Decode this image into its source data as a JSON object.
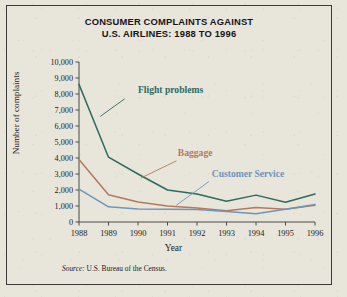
{
  "figure": {
    "title_line1": "CONSUMER COMPLAINTS AGAINST",
    "title_line2": "U.S. AIRLINES: 1988 TO 1996",
    "source_prefix": "Source:",
    "source_text": "U.S. Bureau of the Census.",
    "background_color": "#e8e5da",
    "border_color": "#3a3a38"
  },
  "chart_data": {
    "type": "line",
    "title": "CONSUMER COMPLAINTS AGAINST U.S. AIRLINES: 1988 TO 1996",
    "xlabel": "Year",
    "ylabel": "Number of complaints",
    "x": [
      1988,
      1989,
      1990,
      1991,
      1992,
      1993,
      1994,
      1995,
      1996
    ],
    "xtick_labels": [
      "1988",
      "1989",
      "1990",
      "1991",
      "1992",
      "1993",
      "1994",
      "1995",
      "1996"
    ],
    "ylim": [
      0,
      10000
    ],
    "ytick_values": [
      0,
      1000,
      2000,
      3000,
      4000,
      5000,
      6000,
      7000,
      8000,
      9000,
      10000
    ],
    "ytick_labels": [
      "0",
      "1,000",
      "2,000",
      "3,000",
      "4,000",
      "5,000",
      "6,000",
      "7,000",
      "8,000",
      "9,000",
      "10,000"
    ],
    "grid": false,
    "legend_position": "inline-annotations",
    "series": [
      {
        "name": "Flight problems",
        "color": "#2d6b62",
        "values": [
          8600,
          4050,
          3000,
          2000,
          1750,
          1300,
          1680,
          1230,
          1750
        ],
        "label_x": 1990.0,
        "label_y": 8050,
        "leader_from": [
          1989.55,
          7700
        ],
        "leader_to": [
          1988.72,
          6600
        ]
      },
      {
        "name": "Baggage",
        "color": "#b5795c",
        "values": [
          3900,
          1700,
          1250,
          1000,
          880,
          700,
          900,
          800,
          1050
        ],
        "label_x": 1991.35,
        "label_y": 4150,
        "leader_from": [
          1991.3,
          3820
        ],
        "leader_to": [
          1990.1,
          2750
        ]
      },
      {
        "name": "Customer Service",
        "color": "#6e96bb",
        "values": [
          2050,
          950,
          820,
          800,
          780,
          650,
          520,
          800,
          1100
        ],
        "label_x": 1992.5,
        "label_y": 2800,
        "leader_from": [
          1992.4,
          2520
        ],
        "leader_to": [
          1991.3,
          1050
        ]
      }
    ]
  }
}
